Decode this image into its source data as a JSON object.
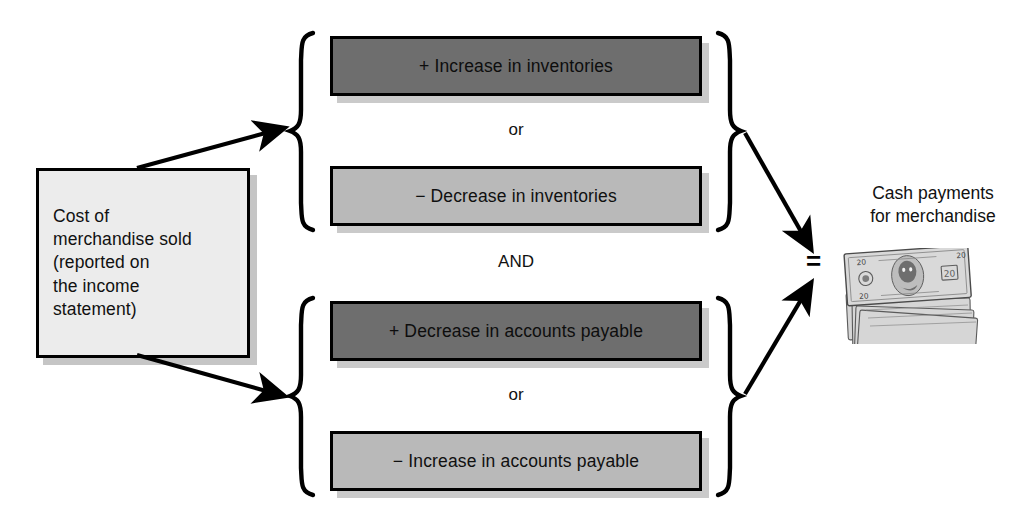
{
  "diagram": {
    "source": {
      "label": "Cost of\nmerchandise sold\n(reported on\nthe income\nstatement)",
      "fill_color": "#ececec",
      "border_color": "#000000"
    },
    "groups": [
      {
        "id": "inventories",
        "connector": "or",
        "terms": [
          {
            "label": "+ Increase in inventories",
            "shade": "dark",
            "fill_color": "#6e6e6e"
          },
          {
            "label": "− Decrease in inventories",
            "shade": "light",
            "fill_color": "#b9b9b9"
          }
        ]
      },
      {
        "id": "accounts-payable",
        "connector": "or",
        "terms": [
          {
            "label": "+ Decrease in accounts payable",
            "shade": "dark",
            "fill_color": "#6e6e6e"
          },
          {
            "label": "− Increase in accounts payable",
            "shade": "light",
            "fill_color": "#b9b9b9"
          }
        ]
      }
    ],
    "group_connector": "AND",
    "equals_symbol": "=",
    "result": {
      "label": "Cash payments\nfor merchandise",
      "icon": "stack-of-banknotes"
    }
  }
}
